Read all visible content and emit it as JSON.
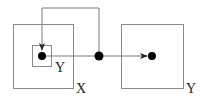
{
  "diagram": {
    "labels": {
      "outer_left": "X",
      "inner_left": "Y",
      "right": "Y"
    },
    "colors": {
      "box_stroke": "#8a8a8a",
      "wire_stroke": "#7a7a7a",
      "node_fill": "#000000"
    }
  }
}
